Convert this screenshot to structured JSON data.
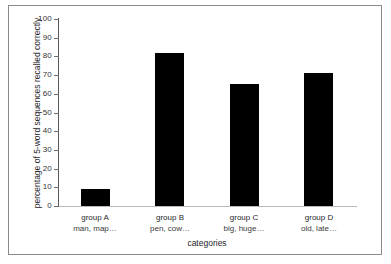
{
  "chart_data": {
    "type": "bar",
    "title": "",
    "subtitle": "",
    "xlabel": "categories",
    "ylabel": "percentage of 5-word sequences recalled correctly",
    "categories": [
      "group A",
      "group B",
      "group C",
      "group D"
    ],
    "category_sublabels": [
      "man, map…",
      "pen, cow…",
      "big, huge…",
      "old, late…"
    ],
    "values": [
      9,
      82,
      65,
      71
    ],
    "ylim": [
      0,
      100
    ],
    "xlim_note": "categorical",
    "yticks": [
      0,
      10,
      20,
      30,
      40,
      50,
      60,
      70,
      80,
      90,
      100
    ],
    "ytick_labels": [
      "0",
      "10",
      "20",
      "30",
      "40",
      "50",
      "60",
      "70",
      "80",
      "90",
      "100"
    ],
    "grid": false,
    "legend": false,
    "legend_position": "none",
    "bar_color": "#000000",
    "axis_color": "#55555a",
    "background_color": "#ffffff",
    "frame_color": "#8a8a8f"
  }
}
